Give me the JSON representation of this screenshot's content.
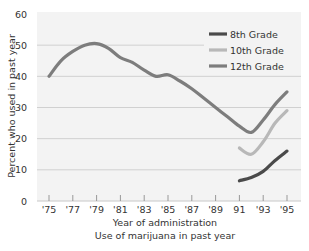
{
  "chart_data": {
    "type": "line",
    "title": "",
    "caption": "Use of marijuana in past year",
    "xlabel": "Year of administration",
    "ylabel": "Percent who used in past year",
    "ylim": [
      0,
      60
    ],
    "yticks": [
      0,
      10,
      20,
      30,
      40,
      50,
      60
    ],
    "xlim": [
      1974,
      1996
    ],
    "xticks": [
      1975,
      1977,
      1979,
      1981,
      1983,
      1985,
      1987,
      1989,
      1991,
      1993,
      1995
    ],
    "xtick_labels": [
      "'75",
      "'77",
      "'79",
      "'81",
      "'83",
      "'85",
      "'87",
      "'89",
      "91",
      "'93",
      "'95"
    ],
    "grid": "horizontal",
    "legend_position": "upper right",
    "series": [
      {
        "name": "8th Grade",
        "color": "#4a4a4a",
        "x": [
          1991,
          1992,
          1993,
          1994,
          1995
        ],
        "values": [
          6.5,
          7.5,
          9.5,
          13,
          16
        ]
      },
      {
        "name": "10th Grade",
        "color": "#b8b8b8",
        "x": [
          1991,
          1992,
          1993,
          1994,
          1995
        ],
        "values": [
          17,
          15,
          19,
          25,
          29
        ]
      },
      {
        "name": "12th Grade",
        "color": "#7d7d7d",
        "x": [
          1975,
          1976,
          1977,
          1978,
          1979,
          1980,
          1981,
          1982,
          1983,
          1984,
          1985,
          1986,
          1987,
          1988,
          1989,
          1990,
          1991,
          1992,
          1993,
          1994,
          1995
        ],
        "values": [
          40,
          45,
          48,
          50,
          50.5,
          49,
          46,
          44.5,
          42,
          40,
          40.5,
          38.5,
          36,
          33,
          30,
          27,
          24,
          22,
          26,
          31,
          35
        ]
      }
    ]
  }
}
